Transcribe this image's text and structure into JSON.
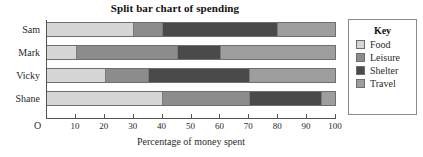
{
  "chart_data": {
    "type": "bar",
    "orientation": "horizontal",
    "stacked": true,
    "title": "Split bar chart of spending",
    "xlabel": "Percentage of money spent",
    "ylabel": "",
    "xlim": [
      0,
      100
    ],
    "xticks": [
      10,
      20,
      30,
      40,
      50,
      60,
      70,
      80,
      90,
      100
    ],
    "origin_label": "O",
    "grid": false,
    "legend_position": "right",
    "legend_title": "Key",
    "categories": [
      "Sam",
      "Mark",
      "Vicky",
      "Shane"
    ],
    "series": [
      {
        "name": "Food",
        "color": "#d6d6d6",
        "values": [
          30,
          10,
          20,
          40
        ]
      },
      {
        "name": "Leisure",
        "color": "#8c8c8c",
        "values": [
          10,
          35,
          15,
          30
        ]
      },
      {
        "name": "Shelter",
        "color": "#4a4a4a",
        "values": [
          40,
          15,
          35,
          25
        ]
      },
      {
        "name": "Travel",
        "color": "#9e9e9e",
        "values": [
          20,
          40,
          30,
          5
        ]
      }
    ],
    "cumulative_boundaries": {
      "Sam": [
        30,
        40,
        80,
        100
      ],
      "Mark": [
        10,
        45,
        60,
        100
      ],
      "Vicky": [
        20,
        35,
        70,
        100
      ],
      "Shane": [
        40,
        70,
        95,
        100
      ]
    }
  },
  "legend": {
    "title": "Key",
    "items": [
      {
        "label": "Food",
        "color": "#d6d6d6"
      },
      {
        "label": "Leisure",
        "color": "#8c8c8c"
      },
      {
        "label": "Shelter",
        "color": "#4a4a4a"
      },
      {
        "label": "Travel",
        "color": "#9e9e9e"
      }
    ]
  }
}
